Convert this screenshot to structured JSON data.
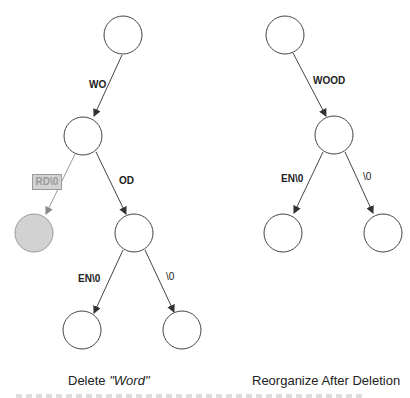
{
  "left_tree": {
    "caption_prefix": "Delete ",
    "caption_word": "\"Word\"",
    "edges": {
      "root_to_n1": "WO",
      "n1_to_deleted": "RD\\0",
      "n1_to_n2": "OD",
      "n2_to_leaf1": "EN\\0",
      "n2_to_leaf2": "\\0"
    },
    "deleted_node_color": "#d2d2d2"
  },
  "right_tree": {
    "caption": "Reorganize After Deletion",
    "edges": {
      "root_to_n1": "WOOD",
      "n1_to_leaf1": "EN\\0",
      "n1_to_leaf2": "\\0"
    }
  },
  "colors": {
    "stroke": "#444444",
    "deleted_fill": "#d2d2d2",
    "deleted_stroke": "#9a9a9a"
  }
}
